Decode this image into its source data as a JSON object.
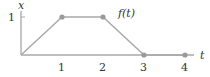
{
  "diagram": {
    "title": "",
    "function_label": "f(t)",
    "x_axis_label": "t",
    "y_axis_label": "x",
    "y_tick_label": "1",
    "x_tick_labels": [
      "1",
      "2",
      "3",
      "4"
    ],
    "points": [
      {
        "t": 0,
        "x": 0
      },
      {
        "t": 1,
        "x": 1
      },
      {
        "t": 2,
        "x": 1
      },
      {
        "t": 3,
        "x": 0
      },
      {
        "t": 4,
        "x": 0
      }
    ],
    "marked_points": [
      {
        "t": 1,
        "x": 1
      },
      {
        "t": 2,
        "x": 1
      },
      {
        "t": 3,
        "x": 0
      },
      {
        "t": 4,
        "x": 0
      }
    ],
    "colors": {
      "line": "#a8a8a8",
      "point": "#999999",
      "axis": "#a8a8a8",
      "text": "#333333"
    }
  }
}
